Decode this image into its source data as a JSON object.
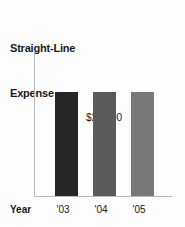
{
  "chart_data": {
    "type": "bar",
    "title": "Straight-Line Expense",
    "title_lines": [
      "Straight-Line",
      "Expense"
    ],
    "categories": [
      "'03",
      "'04",
      "'05"
    ],
    "values": [
      20000,
      20000,
      20000
    ],
    "value_labels": [
      "$20,000"
    ],
    "annotation": "$20,000",
    "xlabel": "Year",
    "ylabel": "",
    "ylim": [
      0,
      28000
    ],
    "grid": false,
    "legend": "none",
    "bar_colors": [
      "#262626",
      "#5a5a5a",
      "#787878"
    ],
    "axis_color": "#b9b9b9",
    "background": "#fdfdfd",
    "text_color": "#1a1a1a",
    "bars": [
      {
        "category": "'03",
        "value": 20000,
        "color": "#262626",
        "label": "'03"
      },
      {
        "category": "'04",
        "value": 20000,
        "color": "#5a5a5a",
        "label": "'04"
      },
      {
        "category": "'05",
        "value": 20000,
        "color": "#787878",
        "label": "'05"
      }
    ]
  }
}
